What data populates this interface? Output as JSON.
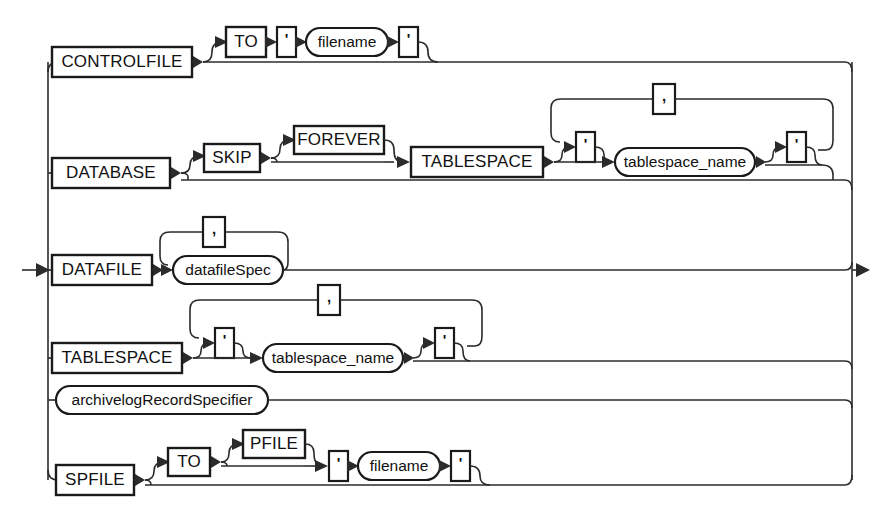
{
  "diagram": {
    "type": "railroad-syntax-diagram",
    "colors": {
      "line": "#2b2b2b",
      "box_border": "#1a1a1a",
      "text": "#111111",
      "background": "#ffffff"
    },
    "entry_marker": "→",
    "exit_marker": "→",
    "separator_literal": ",",
    "quote_literal": "'",
    "branches": [
      {
        "id": "controlfile",
        "keyword": "CONTROLFILE",
        "optional_clause": [
          "TO",
          "'",
          "filename",
          "'"
        ]
      },
      {
        "id": "database",
        "keyword": "DATABASE",
        "optional_clause": [
          "SKIP",
          "FOREVER",
          "TABLESPACE"
        ],
        "list_item": "tablespace_name"
      },
      {
        "id": "datafile",
        "keyword": "DATAFILE",
        "list_item": "datafileSpec"
      },
      {
        "id": "tablespace",
        "keyword": "TABLESPACE",
        "list_item": "tablespace_name"
      },
      {
        "id": "archivelog",
        "nonterminal": "archivelogRecordSpecifier"
      },
      {
        "id": "spfile",
        "keyword": "SPFILE",
        "optional_clause": [
          "TO",
          "PFILE",
          "'",
          "filename",
          "'"
        ]
      }
    ],
    "labels": {
      "controlfile": "CONTROLFILE",
      "database": "DATABASE",
      "datafile": "DATAFILE",
      "tablespace": "TABLESPACE",
      "spfile": "SPFILE",
      "to": "TO",
      "skip": "SKIP",
      "forever": "FOREVER",
      "pfile": "PFILE",
      "quote": "'",
      "comma": ",",
      "filename": "filename",
      "tablespace_name": "tablespace_name",
      "datafileSpec": "datafileSpec",
      "archivelogRecordSpecifier": "archivelogRecordSpecifier"
    }
  }
}
